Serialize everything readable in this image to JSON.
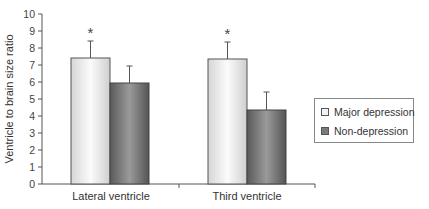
{
  "chart_data": {
    "type": "bar",
    "title": "",
    "xlabel": "",
    "ylabel": "Ventricle to brain size ratio",
    "ylim": [
      0,
      10
    ],
    "yticks": [
      0,
      1,
      2,
      3,
      4,
      5,
      6,
      7,
      8,
      9,
      10
    ],
    "categories": [
      "Lateral ventricle",
      "Third ventricle"
    ],
    "series": [
      {
        "name": "Major depression",
        "values": [
          7.4,
          7.4
        ],
        "error_upper": [
          1.0,
          1.0
        ],
        "color": "#e8e8e8"
      },
      {
        "name": "Non-depression",
        "values": [
          5.9,
          4.4
        ],
        "error_upper": [
          1.0,
          1.0
        ],
        "color": "#7a7a7a"
      }
    ],
    "annotations": [
      {
        "text": "*",
        "category": "Lateral ventricle",
        "series": "Major depression"
      },
      {
        "text": "*",
        "category": "Third ventricle",
        "series": "Major depression"
      }
    ],
    "grid": false,
    "legend_position": "right"
  },
  "axis": {
    "ylabel": "Ventricle to brain size ratio",
    "yticks": [
      "0",
      "1",
      "2",
      "3",
      "4",
      "5",
      "6",
      "7",
      "8",
      "9",
      "10"
    ],
    "categories": [
      "Lateral ventricle",
      "Third ventricle"
    ]
  },
  "legend": {
    "items": [
      {
        "label": "Major depression",
        "color": "#eeeeee"
      },
      {
        "label": "Non-depression",
        "color": "#7a7a7a"
      }
    ]
  },
  "annotations": {
    "significance": "*"
  }
}
